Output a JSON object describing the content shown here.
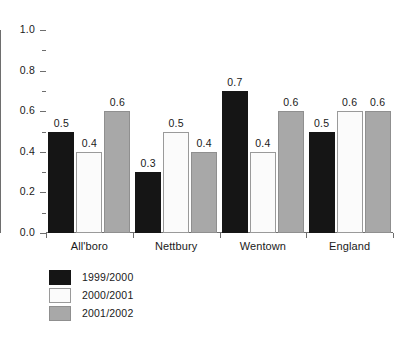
{
  "chart_data": {
    "type": "bar",
    "title": "",
    "subtitle": "",
    "xlabel": "",
    "ylabel": "",
    "ylim": [
      0.0,
      1.0
    ],
    "grid": false,
    "legend_position": "bottom-left",
    "categories": [
      "All'boro",
      "Nettbury",
      "Wentown",
      "England"
    ],
    "ytick_labels": [
      "1.0",
      "0.8",
      "0.6",
      "0.4",
      "0.2",
      "0.0"
    ],
    "ytick_values": [
      1.0,
      0.8,
      0.6,
      0.4,
      0.2,
      0.0
    ],
    "minor_tick_values": [
      0.9,
      0.7,
      0.5,
      0.3,
      0.1
    ],
    "series": [
      {
        "name": "1999/2000",
        "color": "#151515",
        "values": [
          0.5,
          0.3,
          0.7,
          0.5
        ],
        "labels": [
          "0.5",
          "0.3",
          "0.7",
          "0.5"
        ]
      },
      {
        "name": "2000/2001",
        "color": "#fbfbfb",
        "values": [
          0.4,
          0.5,
          0.4,
          0.6
        ],
        "labels": [
          "0.4",
          "0.5",
          "0.4",
          "0.6"
        ]
      },
      {
        "name": "2001/2002",
        "color": "#a8a8a8",
        "values": [
          0.6,
          0.4,
          0.6,
          0.6
        ],
        "labels": [
          "0.6",
          "0.4",
          "0.6",
          "0.6"
        ]
      }
    ]
  },
  "legend": {
    "items": [
      {
        "label": "1999/2000",
        "swatch": "black-swatch"
      },
      {
        "label": "2000/2001",
        "swatch": "white-swatch"
      },
      {
        "label": "2001/2002",
        "swatch": "gray-swatch"
      }
    ]
  }
}
